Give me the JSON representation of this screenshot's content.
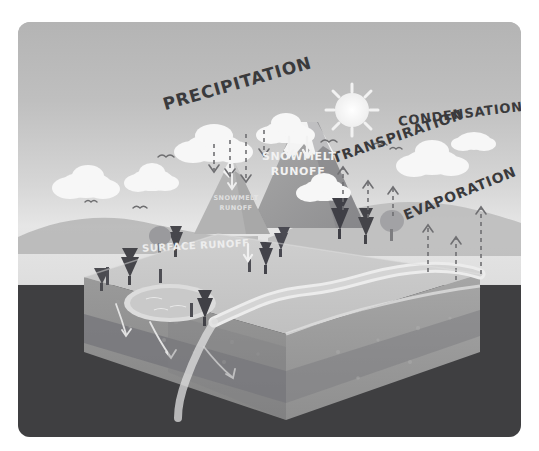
{
  "illustration": {
    "title": "Water Cycle Diagram",
    "style": "hand-drawn isometric cut-away block diagram",
    "colors": {
      "sky_top": "#b4b4b4",
      "sky_bottom": "#e6e6e6",
      "ground_dark": "#3f3f41",
      "terrain_top": "#c8c8c8",
      "terrain_front": "#9b9b9b",
      "terrain_side": "#8d8d8d",
      "aquifer": "#6f6f72",
      "water": "#e4e4e4",
      "cloud": "#f6f6f6",
      "sun": "#f4f4f4",
      "tree_dark": "#4a4a4c",
      "label_text": "#3a3a3c",
      "label_white": "#f2f2f2",
      "page_background": "#ffffff"
    },
    "labels": {
      "precipitation": "PRECIPITATION",
      "condensation": "CONDENSATION",
      "transpiration": "TRANSPIRATION",
      "evaporation": "EVAPORATION",
      "snowmelt_runoff_big": "SNOWMELT RUNOFF",
      "snowmelt_runoff_big_line1": "SNOWMELT",
      "snowmelt_runoff_big_line2": "RUNOFF",
      "snowmelt_runoff_small_line1": "SNOWMELT",
      "snowmelt_runoff_small_line2": "RUNOFF",
      "surface_runoff": "SURFACE RUNOFF"
    },
    "elements": {
      "sun": "sun-icon",
      "clouds_count": 7,
      "birds_count": 6,
      "trees_count": 12,
      "mountains_count": 2,
      "lake": "lake",
      "river": "river",
      "groundwater": "groundwater-aquifer"
    },
    "arrows": {
      "precipitation": {
        "direction": "down",
        "count": 4,
        "style": "dashed"
      },
      "snowmelt_big": {
        "direction": "down",
        "count": 2,
        "style": "solid-white"
      },
      "snowmelt_small": {
        "direction": "down",
        "count": 1,
        "style": "solid-white"
      },
      "surface_runoff": {
        "direction": "down",
        "count": 1,
        "style": "solid-white"
      },
      "transpiration": {
        "direction": "up",
        "count": 3,
        "style": "dashed"
      },
      "evaporation": {
        "direction": "up",
        "count": 3,
        "style": "dashed"
      },
      "groundwater": {
        "direction": "curved",
        "count": 3,
        "style": "solid-white"
      }
    }
  }
}
